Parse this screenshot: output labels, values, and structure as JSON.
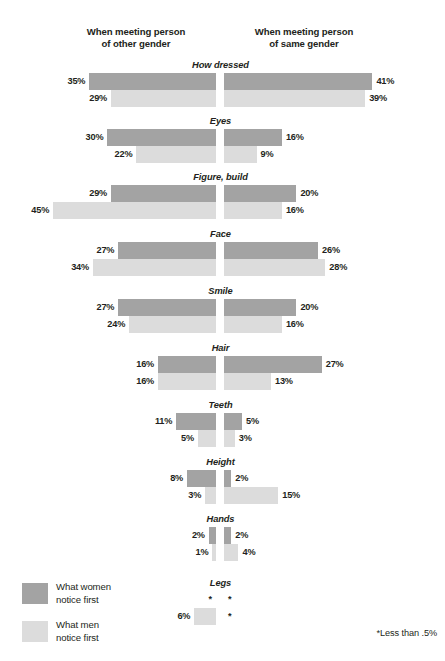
{
  "header": {
    "left": "When meeting person\nof other gender",
    "right": "When meeting person\nof same gender"
  },
  "legend": {
    "women": "What women\nnotice first",
    "men": "What men\nnotice first"
  },
  "footnote": "*Less than .5%",
  "colors": {
    "women": "#a3a3a3",
    "men": "#dcdcdc",
    "text": "#231f20",
    "background": "#ffffff"
  },
  "chart_data": {
    "type": "bar",
    "title": "",
    "subtype": "diverging-butterfly",
    "xlabel": "",
    "ylabel": "",
    "grid": false,
    "legend_position": "bottom-left",
    "panels": [
      "When meeting person of other gender",
      "When meeting person of same gender"
    ],
    "series": [
      {
        "name": "What women notice first",
        "color": "#a3a3a3"
      },
      {
        "name": "What men notice first",
        "color": "#dcdcdc"
      }
    ],
    "categories": [
      "How dressed",
      "Eyes",
      "Figure, build",
      "Face",
      "Smile",
      "Hair",
      "Teeth",
      "Height",
      "Hands",
      "Legs"
    ],
    "rows": [
      {
        "category": "How dressed",
        "top": 60,
        "women": {
          "left": 35,
          "right": 41,
          "left_label": "35%",
          "right_label": "41%"
        },
        "men": {
          "left": 29,
          "right": 39,
          "left_label": "29%",
          "right_label": "39%"
        }
      },
      {
        "category": "Eyes",
        "top": 116,
        "women": {
          "left": 30,
          "right": 16,
          "left_label": "30%",
          "right_label": "16%"
        },
        "men": {
          "left": 22,
          "right": 9,
          "left_label": "22%",
          "right_label": "9%"
        }
      },
      {
        "category": "Figure, build",
        "top": 172,
        "women": {
          "left": 29,
          "right": 20,
          "left_label": "29%",
          "right_label": "20%"
        },
        "men": {
          "left": 45,
          "right": 16,
          "left_label": "45%",
          "right_label": "16%"
        }
      },
      {
        "category": "Face",
        "top": 229,
        "women": {
          "left": 27,
          "right": 26,
          "left_label": "27%",
          "right_label": "26%"
        },
        "men": {
          "left": 34,
          "right": 28,
          "left_label": "34%",
          "right_label": "28%"
        }
      },
      {
        "category": "Smile",
        "top": 286,
        "women": {
          "left": 27,
          "right": 20,
          "left_label": "27%",
          "right_label": "20%"
        },
        "men": {
          "left": 24,
          "right": 16,
          "left_label": "24%",
          "right_label": "16%"
        }
      },
      {
        "category": "Hair",
        "top": 343,
        "women": {
          "left": 16,
          "right": 27,
          "left_label": "16%",
          "right_label": "27%"
        },
        "men": {
          "left": 16,
          "right": 13,
          "left_label": "16%",
          "right_label": "13%"
        }
      },
      {
        "category": "Teeth",
        "top": 400,
        "women": {
          "left": 11,
          "right": 5,
          "left_label": "11%",
          "right_label": "5%"
        },
        "men": {
          "left": 5,
          "right": 3,
          "left_label": "5%",
          "right_label": "3%"
        }
      },
      {
        "category": "Height",
        "top": 457,
        "women": {
          "left": 8,
          "right": 2,
          "left_label": "8%",
          "right_label": "2%"
        },
        "men": {
          "left": 3,
          "right": 15,
          "left_label": "3%",
          "right_label": "15%"
        }
      },
      {
        "category": "Hands",
        "top": 514,
        "women": {
          "left": 2,
          "right": 2,
          "left_label": "2%",
          "right_label": "2%"
        },
        "men": {
          "left": 1,
          "right": 4,
          "left_label": "1%",
          "right_label": "4%"
        }
      },
      {
        "category": "Legs",
        "top": 578,
        "women": {
          "left": 0,
          "right": 0,
          "left_label": "*",
          "right_label": "*"
        },
        "men": {
          "left": 6,
          "right": 0,
          "left_label": "6%",
          "right_label": "*"
        }
      }
    ]
  }
}
